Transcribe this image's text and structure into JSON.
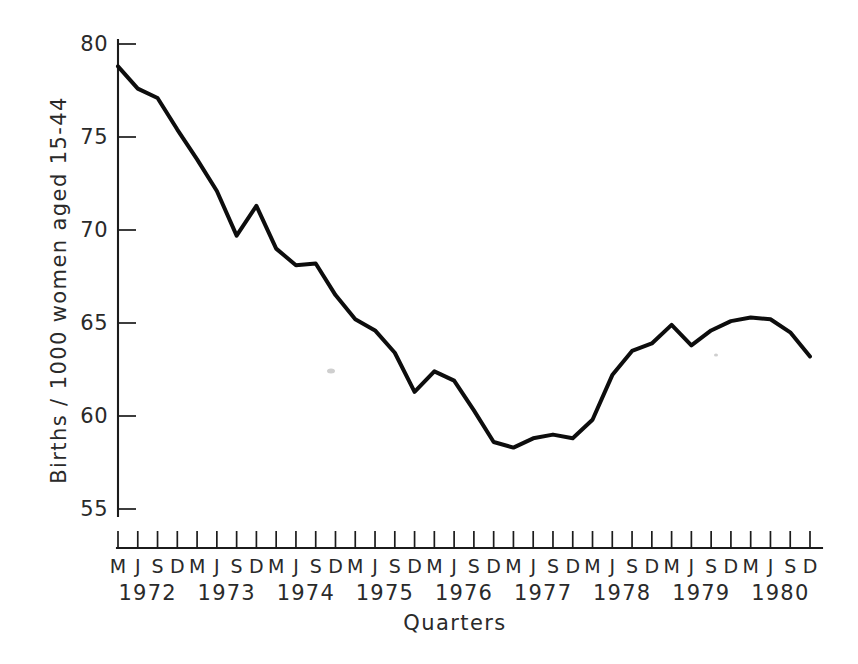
{
  "chart_data": {
    "type": "line",
    "title": "",
    "xlabel": "Quarters",
    "ylabel": "Births / 1000 women aged 15-44",
    "ylim": [
      55,
      80
    ],
    "yticks": [
      55,
      60,
      65,
      70,
      75,
      80
    ],
    "ytick_labels": [
      "55",
      "60",
      "65",
      "70",
      "75",
      "80"
    ],
    "grid": false,
    "legend": "none",
    "x_quarter_labels": [
      "M",
      "J",
      "S",
      "D",
      "M",
      "J",
      "S",
      "D",
      "M",
      "J",
      "S",
      "D",
      "M",
      "J",
      "S",
      "D",
      "M",
      "J",
      "S",
      "D",
      "M",
      "J",
      "S",
      "D",
      "M",
      "J",
      "S",
      "D",
      "M",
      "J",
      "S",
      "D",
      "M",
      "J",
      "S",
      "D"
    ],
    "x_year_labels": [
      "1972",
      "1973",
      "1974",
      "1975",
      "1976",
      "1977",
      "1978",
      "1979",
      "1980"
    ],
    "x": [
      "1972 M",
      "1972 J",
      "1972 S",
      "1972 D",
      "1973 M",
      "1973 J",
      "1973 S",
      "1973 D",
      "1974 M",
      "1974 J",
      "1974 S",
      "1974 D",
      "1975 M",
      "1975 J",
      "1975 S",
      "1975 D",
      "1976 M",
      "1976 J",
      "1976 S",
      "1976 D",
      "1977 M",
      "1977 J",
      "1977 S",
      "1977 D",
      "1978 M",
      "1978 J",
      "1978 S",
      "1978 D",
      "1979 M",
      "1979 J",
      "1979 S",
      "1979 D",
      "1980 M",
      "1980 J",
      "1980 S",
      "1980 D"
    ],
    "values": [
      78.8,
      77.6,
      77.1,
      75.4,
      73.8,
      72.1,
      69.7,
      71.3,
      69.0,
      68.1,
      68.2,
      66.5,
      65.2,
      64.6,
      63.4,
      61.3,
      62.4,
      61.9,
      60.3,
      58.6,
      58.3,
      58.8,
      59.0,
      58.8,
      59.8,
      62.2,
      63.5,
      63.9,
      64.9,
      63.8,
      64.6,
      65.1,
      65.3,
      65.2,
      64.5,
      63.2
    ],
    "series_name": "Birth rate",
    "line_color": "#0d0d0d"
  },
  "axis": {
    "x_title": "Quarters",
    "y_title": "Births / 1000 women aged 15-44"
  }
}
